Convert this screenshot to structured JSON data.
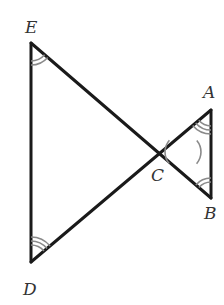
{
  "diagram": {
    "type": "geometry-figure",
    "points": {
      "E": {
        "label": "E",
        "x": 31,
        "y": 43
      },
      "D": {
        "label": "D",
        "x": 31,
        "y": 262
      },
      "A": {
        "label": "A",
        "x": 211,
        "y": 110
      },
      "B": {
        "label": "B",
        "x": 211,
        "y": 198
      },
      "C": {
        "label": "C",
        "x": 183,
        "y": 152
      }
    },
    "segments": [
      {
        "from": "E",
        "to": "D"
      },
      {
        "from": "E",
        "to": "B"
      },
      {
        "from": "D",
        "to": "A"
      },
      {
        "from": "A",
        "to": "B"
      }
    ],
    "angle_marks": [
      {
        "vertex": "E",
        "arcs": 2
      },
      {
        "vertex": "D",
        "arcs": 3
      },
      {
        "vertex": "A",
        "arcs": 3
      },
      {
        "vertex": "B",
        "arcs": 2
      },
      {
        "vertex": "C",
        "arcs": 1,
        "side": "left"
      },
      {
        "vertex": "C",
        "arcs": 1,
        "side": "right"
      }
    ],
    "colors": {
      "line": "#1a1a1a",
      "arc": "#8a8a8a",
      "label": "#333333"
    }
  },
  "labels": {
    "E": "E",
    "D": "D",
    "A": "A",
    "B": "B",
    "C": "C"
  }
}
